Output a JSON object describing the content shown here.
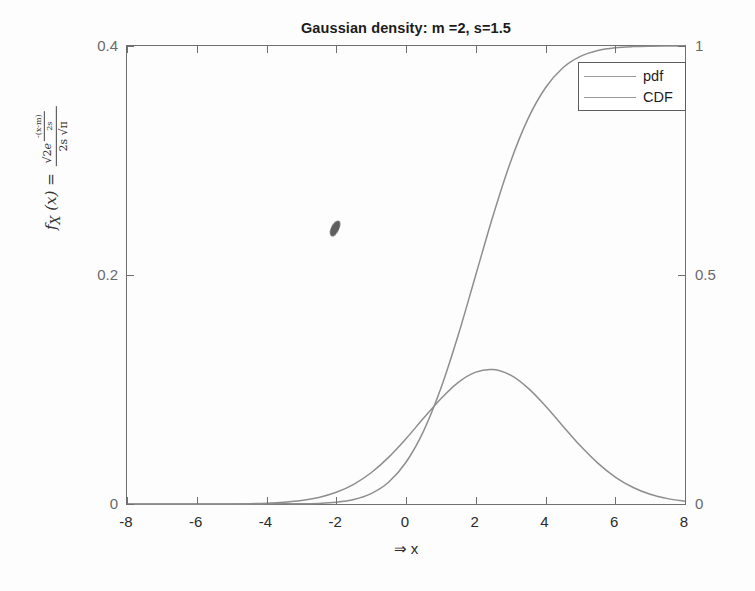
{
  "chart_data": {
    "type": "line",
    "title": "Gaussian density: m =2, s=1.5",
    "xlabel": "⇒ x",
    "ylabel_latex": "f_X (x) = √2 e^{-(x-m)^2 / 2s^2} / (2 s √π)",
    "xlim": [
      -8,
      8
    ],
    "ylim_left": [
      0,
      0.4
    ],
    "ylim_right": [
      0,
      1
    ],
    "xticks": [
      -8,
      -6,
      -4,
      -2,
      0,
      2,
      4,
      6,
      8
    ],
    "yticks_left": [
      0,
      0.2,
      0.4
    ],
    "yticks_right": [
      0,
      0.5,
      1
    ],
    "xticklabels": [
      "-8",
      "-6",
      "-4",
      "-2",
      "0",
      "2",
      "4",
      "6",
      "8"
    ],
    "yticklabels_left": [
      "0",
      "0.2",
      "0.4"
    ],
    "yticklabels_right": [
      "0",
      "0.5",
      "1"
    ],
    "grid": false,
    "legend_position": "top-right",
    "parameters": {
      "mean": 2,
      "sigma": 1.5
    },
    "series": [
      {
        "name": "pdf",
        "axis": "left",
        "color": "#8e8e8e",
        "x": [
          -8,
          -7.5,
          -7,
          -6.5,
          -6,
          -5.5,
          -5,
          -4.5,
          -4,
          -3.5,
          -3,
          -2.5,
          -2,
          -1.5,
          -1,
          -0.5,
          0,
          0.5,
          1,
          1.5,
          2,
          2.5,
          3,
          3.5,
          4,
          4.5,
          5,
          5.5,
          6,
          6.5,
          7,
          7.5,
          8
        ],
        "y": [
          0.0,
          0.0,
          0.0,
          0.0,
          0.0,
          0.0001,
          0.0001,
          0.0003,
          0.0007,
          0.0015,
          0.003,
          0.0057,
          0.0102,
          0.0172,
          0.0273,
          0.0407,
          0.057,
          0.0748,
          0.092,
          0.1063,
          0.1152,
          0.1174,
          0.1125,
          0.1012,
          0.0856,
          0.068,
          0.0508,
          0.0357,
          0.0235,
          0.0146,
          0.0085,
          0.0047,
          0.0024
        ]
      },
      {
        "name": "CDF",
        "axis": "right",
        "color": "#8e8e8e",
        "x": [
          -8,
          -7.5,
          -7,
          -6.5,
          -6,
          -5.5,
          -5,
          -4.5,
          -4,
          -3.5,
          -3,
          -2.5,
          -2,
          -1.5,
          -1,
          -0.5,
          0,
          0.5,
          1,
          1.5,
          2,
          2.5,
          3,
          3.5,
          4,
          4.5,
          5,
          5.5,
          6,
          6.5,
          7,
          7.5,
          8
        ],
        "y": [
          0.0,
          0.0,
          0.0,
          0.0,
          0.0,
          0.0,
          0.0001,
          0.0002,
          0.0004,
          0.0009,
          0.0004,
          0.0013,
          0.0038,
          0.0098,
          0.0228,
          0.0475,
          0.0912,
          0.1587,
          0.2525,
          0.3694,
          0.5,
          0.6306,
          0.7475,
          0.8413,
          0.9088,
          0.9525,
          0.9772,
          0.9901,
          0.9962,
          0.9987,
          0.9996,
          0.9999,
          1.0
        ]
      }
    ],
    "annotations": [
      {
        "name": "ink-artifact",
        "x": -2.0,
        "y": 0.24,
        "axis": "left",
        "shape": "small dark blob"
      }
    ]
  },
  "legend": {
    "items": [
      {
        "label": "pdf"
      },
      {
        "label": "CDF"
      }
    ]
  },
  "axes": {
    "x_title": "⇒ x",
    "y_title_parts": {
      "fx": "f",
      "sub": "X",
      "arg": "(x)",
      "equals": "=",
      "num_sqrt2": "√2",
      "num_e": "e",
      "exp_top": "-(x-m)",
      "exp_top_pow": "2",
      "exp_bot": "2s",
      "exp_bot_pow": "2",
      "den": "2s √π"
    }
  }
}
